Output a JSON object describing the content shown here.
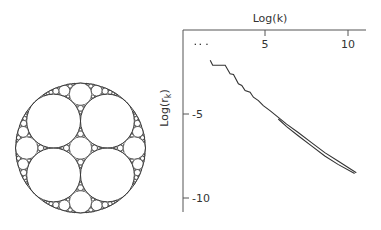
{
  "figure": {
    "left_panel": {
      "description": "Apollonian gasket packing with four equal inner circles",
      "inner_circle_count": 4
    },
    "colors": {
      "ink": "#333333",
      "axis": "#444444",
      "background": "#ffffff"
    }
  },
  "chart_data": {
    "type": "scatter",
    "title": "",
    "xlabel": "Log(k)",
    "ylabel": "Log(r_k)",
    "ylabel_main": "Log(r",
    "ylabel_sub": "k",
    "ylabel_close": ")",
    "xlim": [
      0,
      11
    ],
    "ylim": [
      -10.7,
      0
    ],
    "x_axis_position": "top",
    "grid": false,
    "xticks": [
      {
        "value": 5,
        "label": "5"
      },
      {
        "value": 10,
        "label": "10"
      }
    ],
    "yticks": [
      {
        "value": -5,
        "label": "-5"
      },
      {
        "value": -10,
        "label": "-10"
      }
    ],
    "series": [
      {
        "name": "upper",
        "points": [
          [
            0.8,
            -0.85
          ],
          [
            1.1,
            -0.85
          ],
          [
            1.5,
            -0.85
          ],
          [
            1.7,
            -1.8
          ],
          [
            1.85,
            -2.1
          ],
          [
            2.2,
            -2.1
          ],
          [
            2.6,
            -2.1
          ],
          [
            2.9,
            -2.6
          ],
          [
            3.1,
            -2.65
          ],
          [
            3.4,
            -3.2
          ],
          [
            3.6,
            -3.3
          ],
          [
            3.8,
            -3.6
          ],
          [
            4.1,
            -3.7
          ],
          [
            4.3,
            -4.0
          ],
          [
            4.6,
            -4.2
          ],
          [
            4.9,
            -4.5
          ],
          [
            5.3,
            -4.8
          ],
          [
            5.8,
            -5.2
          ],
          [
            6.3,
            -5.6
          ],
          [
            7.0,
            -6.1
          ],
          [
            7.8,
            -6.7
          ],
          [
            8.6,
            -7.3
          ],
          [
            9.4,
            -7.8
          ],
          [
            10.5,
            -8.5
          ]
        ]
      },
      {
        "name": "lower",
        "points": [
          [
            5.8,
            -5.3
          ],
          [
            6.3,
            -5.75
          ],
          [
            7.0,
            -6.3
          ],
          [
            7.8,
            -6.9
          ],
          [
            8.6,
            -7.5
          ],
          [
            9.4,
            -8.0
          ],
          [
            10.4,
            -8.55
          ]
        ]
      }
    ]
  }
}
